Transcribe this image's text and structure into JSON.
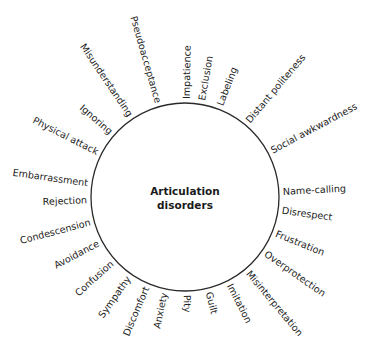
{
  "diagram": {
    "center": {
      "line1": "Articulation",
      "line2": "disorders"
    },
    "circle": {
      "cx": 185,
      "cy": 197,
      "r": 94,
      "stroke": "#2a2a2a"
    },
    "text_color": "#222222",
    "labels": [
      {
        "text": "Impatience",
        "angle": -89
      },
      {
        "text": "Exclusion",
        "angle": -80
      },
      {
        "text": "Labeling",
        "angle": -69
      },
      {
        "text": "Distant politeness",
        "angle": -50
      },
      {
        "text": "Social awkwardness",
        "angle": -28
      },
      {
        "text": "Name-calling",
        "angle": -3
      },
      {
        "text": "Disrespect",
        "angle": 8
      },
      {
        "text": "Frustration",
        "angle": 22
      },
      {
        "text": "Overprotection",
        "angle": 35
      },
      {
        "text": "Misinterpretation",
        "angle": 50
      },
      {
        "text": "Imitation",
        "angle": 63
      },
      {
        "text": "Guilt",
        "angle": 76
      },
      {
        "text": "Pity",
        "angle": 89
      },
      {
        "text": "Anxiety",
        "angle": 102
      },
      {
        "text": "Discomfort",
        "angle": 113
      },
      {
        "text": "Sympathy",
        "angle": 125
      },
      {
        "text": "Confusion",
        "angle": 138
      },
      {
        "text": "Avoidance",
        "angle": 152
      },
      {
        "text": "Condescension",
        "angle": 165
      },
      {
        "text": "Rejection",
        "angle": 178
      },
      {
        "text": "Embarrassment",
        "angle": 188
      },
      {
        "text": "Physical attack",
        "angle": 207
      },
      {
        "text": "Ignoring",
        "angle": 221
      },
      {
        "text": "Misunderstanding",
        "angle": 236
      },
      {
        "text": "Pseudoacceptance",
        "angle": 254
      }
    ]
  }
}
